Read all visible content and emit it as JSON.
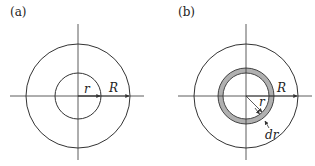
{
  "panels": [
    {
      "label": "(a)",
      "inner_radius_label": "r",
      "outer_radius_label": "R"
    },
    {
      "label": "(b)",
      "inner_radius_label": "r",
      "outer_radius_label": "R",
      "ring_width_label": "dr"
    }
  ],
  "colors": {
    "stroke": "#333333",
    "ring_fill": "#b0b0b0"
  }
}
